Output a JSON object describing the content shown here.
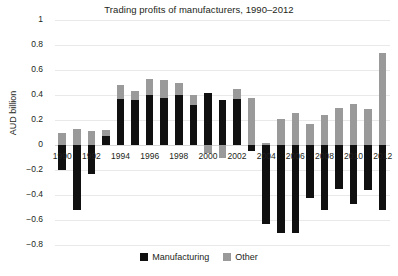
{
  "chart_data": {
    "type": "bar",
    "title": "Trading profits of manufacturers, 1990–2012",
    "xlabel": "",
    "ylabel": "AUD billion",
    "ylim": [
      -0.8,
      1
    ],
    "ytick_values": [
      1,
      0.8,
      0.6,
      0.4,
      0.2,
      0,
      -0.2,
      -0.4,
      -0.6,
      -0.8
    ],
    "ytick_labels": [
      "1",
      "0.8",
      "0.6",
      "0.4",
      "0.2",
      "0",
      "−0.2",
      "−0.4",
      "−0.6",
      "−0.8"
    ],
    "grid": true,
    "stacked": true,
    "legend_position": "bottom",
    "categories": [
      "1990",
      "1991",
      "1992",
      "1993",
      "1994",
      "1995",
      "1996",
      "1997",
      "1998",
      "1999",
      "2000",
      "2001",
      "2002",
      "2003",
      "2004",
      "2005",
      "2006",
      "2007",
      "2008",
      "2009",
      "2010",
      "2011",
      "2012"
    ],
    "xtick_labels": [
      "1990",
      "1992",
      "1994",
      "1996",
      "1998",
      "2000",
      "2002",
      "2004",
      "2006",
      "2008",
      "2010",
      "2012"
    ],
    "series": [
      {
        "name": "Manufacturing",
        "color": "#101010",
        "values": [
          -0.2,
          -0.52,
          -0.23,
          0.07,
          0.37,
          0.36,
          0.4,
          0.38,
          0.4,
          0.32,
          0.42,
          0.36,
          0.37,
          -0.05,
          -0.63,
          -0.7,
          -0.7,
          -0.42,
          -0.52,
          -0.35,
          -0.47,
          -0.36,
          -0.52
        ]
      },
      {
        "name": "Other",
        "color": "#9a9a9a",
        "values": [
          0.1,
          0.13,
          0.11,
          0.05,
          0.11,
          0.07,
          0.13,
          0.14,
          0.1,
          0.08,
          -0.06,
          -0.1,
          0.08,
          0.38,
          0.02,
          0.21,
          0.26,
          0.17,
          0.24,
          0.3,
          0.33,
          0.29,
          0.74
        ]
      }
    ]
  },
  "legend": {
    "items": [
      {
        "label": "Manufacturing",
        "color": "#101010"
      },
      {
        "label": "Other",
        "color": "#9a9a9a"
      }
    ]
  }
}
